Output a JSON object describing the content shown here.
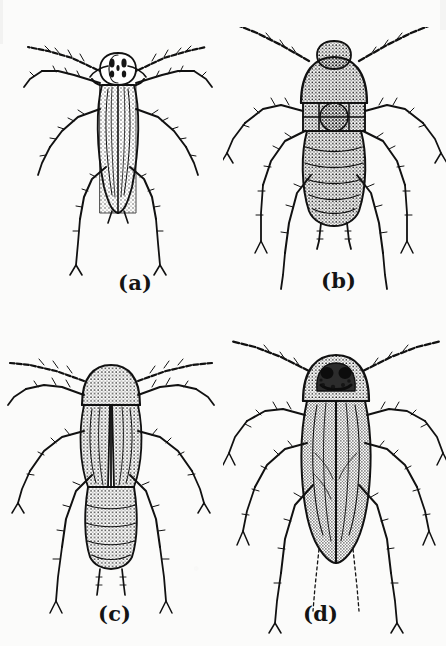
{
  "plate": {
    "title": "Cockroach developmental stages",
    "medium": "black-and-white stippled ink line drawing",
    "background_color": "#fbfbfa",
    "ink_color": "#111111",
    "layout": "2x2 grid of four labeled specimens"
  },
  "figures": [
    {
      "id": "a",
      "label": "(a)",
      "subject": "early-instar nymph, dorsal view",
      "description": "slender elongate body, banded pronotum with dark blotches, long spiny legs and filiform antennae",
      "position": "top-left"
    },
    {
      "id": "b",
      "label": "(b)",
      "subject": "wingless nymph, dorsal view",
      "description": "broad rounded pronotum, heavily stippled segmented abdomen, paired cerci, long sprawling legs",
      "position": "top-right"
    },
    {
      "id": "c",
      "label": "(c)",
      "subject": "late-instar nymph with wing pads, dorsal view",
      "description": "rounded pronotum, short veined wing pads covering thorax, exposed segmented abdomen with cerci",
      "position": "bottom-left"
    },
    {
      "id": "d",
      "label": "(d)",
      "subject": "adult, dorsal view",
      "description": "full-length veined tegmina covering abdomen, dark patch with two black spots on pronotum, long legs and antennae",
      "position": "bottom-right"
    }
  ]
}
